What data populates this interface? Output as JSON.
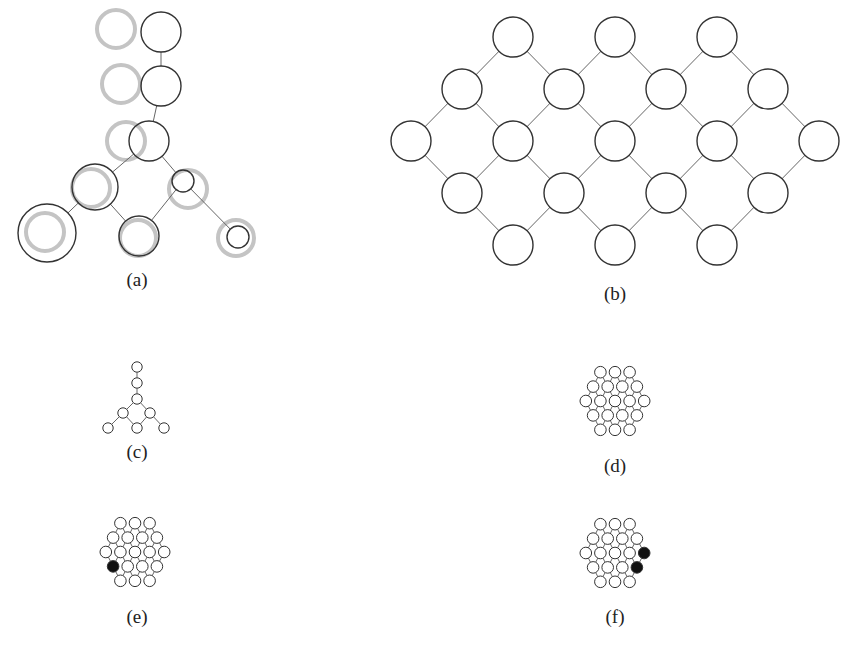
{
  "figure": {
    "panels": [
      {
        "id": "a",
        "label": "(a)",
        "label_pos": [
          137,
          283
        ]
      },
      {
        "id": "b",
        "label": "(b)",
        "label_pos": [
          615,
          297
        ]
      },
      {
        "id": "c",
        "label": "(c)",
        "label_pos": [
          137,
          455
        ]
      },
      {
        "id": "d",
        "label": "(d)",
        "label_pos": [
          615,
          469
        ]
      },
      {
        "id": "e",
        "label": "(e)",
        "label_pos": [
          137,
          620
        ]
      },
      {
        "id": "f",
        "label": "(f)",
        "label_pos": [
          615,
          620
        ]
      }
    ],
    "colors": {
      "stroke": "#333333",
      "ghost": "#c4c4c4",
      "filled": "#111111",
      "edge": "#666666"
    },
    "panel_a": {
      "nodes": [
        {
          "x": 161,
          "y": 32,
          "r": 20
        },
        {
          "x": 161,
          "y": 86,
          "r": 20
        },
        {
          "x": 149,
          "y": 141,
          "r": 20
        },
        {
          "x": 95,
          "y": 187,
          "r": 23
        },
        {
          "x": 183,
          "y": 181,
          "r": 11
        },
        {
          "x": 47,
          "y": 233,
          "r": 29
        },
        {
          "x": 139,
          "y": 236,
          "r": 20
        },
        {
          "x": 238,
          "y": 237,
          "r": 11
        }
      ],
      "ghosts": [
        {
          "x": 116,
          "y": 29,
          "r": 19
        },
        {
          "x": 121,
          "y": 84,
          "r": 19
        },
        {
          "x": 126,
          "y": 141,
          "r": 19
        },
        {
          "x": 91,
          "y": 188,
          "r": 19
        },
        {
          "x": 188,
          "y": 189,
          "r": 19
        },
        {
          "x": 45,
          "y": 232,
          "r": 19
        },
        {
          "x": 138,
          "y": 238,
          "r": 18
        },
        {
          "x": 236,
          "y": 238,
          "r": 18
        }
      ],
      "edges": [
        [
          0,
          1
        ],
        [
          1,
          2
        ],
        [
          2,
          3
        ],
        [
          2,
          4
        ],
        [
          3,
          5
        ],
        [
          3,
          6
        ],
        [
          4,
          6
        ],
        [
          4,
          7
        ]
      ]
    },
    "lattice": {
      "rows": [
        3,
        4,
        5,
        4,
        3
      ]
    },
    "panel_b": {
      "cx": 615,
      "cy": 141,
      "dx": 102,
      "dy": 52,
      "r": 20
    },
    "panel_c": {
      "nodes": [
        [
          137,
          367
        ],
        [
          137,
          383
        ],
        [
          137,
          399
        ],
        [
          123,
          413
        ],
        [
          150,
          413
        ],
        [
          108,
          428
        ],
        [
          137,
          428
        ],
        [
          164,
          428
        ]
      ],
      "edges": [
        [
          0,
          1
        ],
        [
          1,
          2
        ],
        [
          2,
          3
        ],
        [
          2,
          4
        ],
        [
          3,
          5
        ],
        [
          3,
          6
        ],
        [
          4,
          6
        ],
        [
          4,
          7
        ]
      ],
      "r": 5.2
    },
    "panel_d": {
      "cx": 615,
      "cy": 401,
      "dx": 14.6,
      "dy": 14.4,
      "r": 5.8,
      "filled": []
    },
    "panel_e": {
      "cx": 135,
      "cy": 552,
      "dx": 14.6,
      "dy": 14.4,
      "r": 5.8,
      "filled": [
        [
          3,
          0
        ]
      ]
    },
    "panel_f": {
      "cx": 615,
      "cy": 553,
      "dx": 14.6,
      "dy": 14.4,
      "r": 5.8,
      "filled": [
        [
          2,
          4
        ],
        [
          3,
          3
        ]
      ]
    }
  }
}
